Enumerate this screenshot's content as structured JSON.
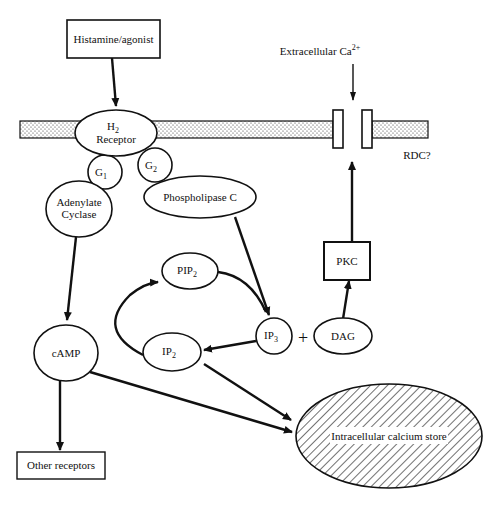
{
  "diagram": {
    "title": "",
    "nodes": {
      "histamine": {
        "label": "Histamine/agonist"
      },
      "h2_receptor": {
        "label_main": "H",
        "label_sub": "2",
        "label_line2": "Receptor"
      },
      "g1": {
        "label_main": "G",
        "label_sub": "1"
      },
      "g2": {
        "label_main": "G",
        "label_sub": "2"
      },
      "adenylate_cyclase": {
        "label_line1": "Adenylate",
        "label_line2": "Cyclase"
      },
      "phospholipase_c": {
        "label": "Phospholipase C"
      },
      "pip2": {
        "label_main": "PIP",
        "label_sub": "2"
      },
      "ip2": {
        "label_main": "IP",
        "label_sub": "2"
      },
      "ip3": {
        "label_main": "IP",
        "label_sub": "3"
      },
      "plus": {
        "label": "+"
      },
      "dag": {
        "label": "DAG"
      },
      "pkc": {
        "label": "PKC"
      },
      "camp": {
        "label": "cAMP"
      },
      "other_receptors": {
        "label": "Other receptors"
      },
      "calcium_store": {
        "label": "Intracellular calcium store"
      },
      "extracellular_ca": {
        "label_main": "Extracellular Ca",
        "label_sup": "2+"
      },
      "rdc": {
        "label": "RDC?"
      }
    },
    "edges": [
      {
        "from": "Histamine/agonist",
        "to": "H2 Receptor"
      },
      {
        "from": "Adenylate Cyclase",
        "to": "cAMP"
      },
      {
        "from": "Phospholipase C",
        "to": "IP3"
      },
      {
        "from": "PIP2",
        "to": "IP3"
      },
      {
        "from": "IP3",
        "to": "IP2"
      },
      {
        "from": "IP2",
        "to": "PIP2"
      },
      {
        "from": "DAG",
        "to": "PKC"
      },
      {
        "from": "PKC",
        "to": "RDC channel"
      },
      {
        "from": "Extracellular Ca2+",
        "to": "RDC channel"
      },
      {
        "from": "cAMP",
        "to": "Other receptors"
      },
      {
        "from": "cAMP",
        "to": "Intracellular calcium store"
      },
      {
        "from": "IP2",
        "to": "Intracellular calcium store"
      }
    ]
  }
}
